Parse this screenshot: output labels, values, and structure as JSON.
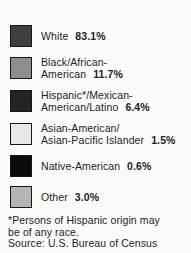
{
  "legend": {
    "items": [
      {
        "name": "White",
        "line2": "White",
        "value": "83.1%",
        "color": "#3f3f3f"
      },
      {
        "name": "Black/African-American",
        "line1": "Black/African-",
        "line2": "American",
        "value": "11.7%",
        "color": "#8e8e8e"
      },
      {
        "name": "Hispanic*/Mexican-American/Latino",
        "line1": "Hispanic*/Mexican-",
        "line2": "American/Latino",
        "value": "6.4%",
        "color": "#242424"
      },
      {
        "name": "Asian-American/Asian-Pacific Islander",
        "line1": "Asian-American/",
        "line2": "Asian-Pacific Islander",
        "value": "1.5%",
        "color": "#e8e8e6"
      },
      {
        "name": "Native-American",
        "line2": "Native-American",
        "value": "0.6%",
        "color": "#0b0b0b"
      },
      {
        "name": "Other",
        "line2": "Other",
        "value": "3.0%",
        "color": "#b5b5b3"
      }
    ]
  },
  "footnote": {
    "line1": "*Persons of Hispanic origin may",
    "line2": "be of any race.",
    "source": "Source: U.S. Bureau of Census"
  },
  "chart_data": {
    "type": "table",
    "title": "",
    "categories": [
      "White",
      "Black/African-American",
      "Hispanic*/Mexican-American/Latino",
      "Asian-American/Asian-Pacific Islander",
      "Native-American",
      "Other"
    ],
    "values": [
      83.1,
      11.7,
      6.4,
      1.5,
      0.6,
      3.0
    ],
    "unit": "%",
    "legend_colors": [
      "#3f3f3f",
      "#8e8e8e",
      "#242424",
      "#e8e8e6",
      "#0b0b0b",
      "#b5b5b3"
    ],
    "annotations": [
      "*Persons of Hispanic origin may be of any race.",
      "Source: U.S. Bureau of Census"
    ]
  }
}
